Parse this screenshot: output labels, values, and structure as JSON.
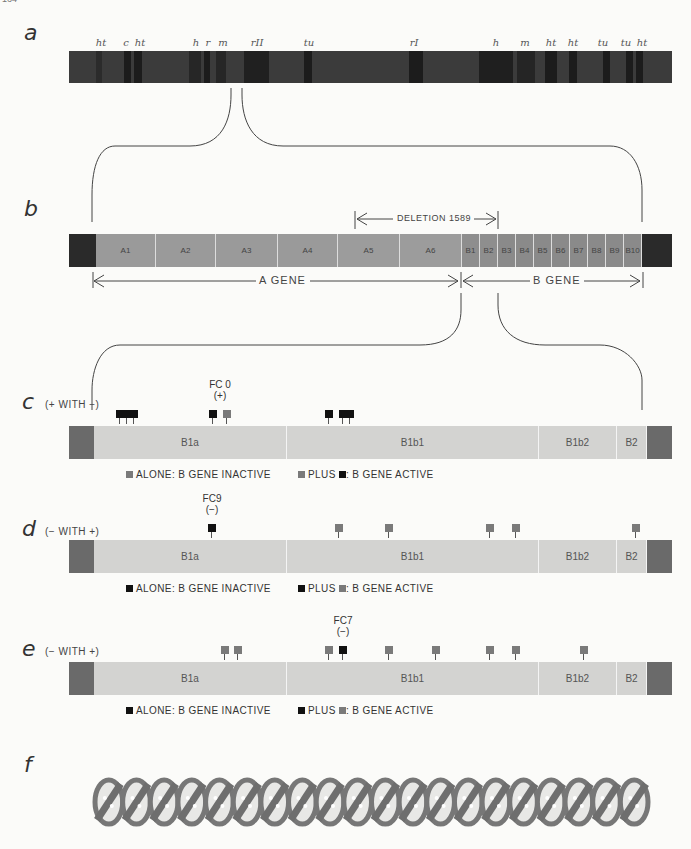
{
  "page_number": "164",
  "panels": {
    "a": {
      "letter": "a",
      "markers": [
        {
          "label": "ht",
          "x": 101
        },
        {
          "label": "c",
          "x": 126
        },
        {
          "label": "ht",
          "x": 140
        },
        {
          "label": "h",
          "x": 196
        },
        {
          "label": "r",
          "x": 208
        },
        {
          "label": "m",
          "x": 223
        },
        {
          "label": "rII",
          "x": 257
        },
        {
          "label": "tu",
          "x": 309
        },
        {
          "label": "rI",
          "x": 414
        },
        {
          "label": "h",
          "x": 496
        },
        {
          "label": "m",
          "x": 525
        },
        {
          "label": "ht",
          "x": 551
        },
        {
          "label": "ht",
          "x": 573
        },
        {
          "label": "tu",
          "x": 603
        },
        {
          "label": "tu",
          "x": 626
        },
        {
          "label": "ht",
          "x": 642
        }
      ]
    },
    "b": {
      "letter": "b",
      "deletion_label": "DELETION 1589",
      "a_gene_label": "A GENE",
      "b_gene_label": "B GENE",
      "segments": [
        "A1",
        "A2",
        "A3",
        "A4",
        "A5",
        "A6",
        "B1",
        "B2",
        "B3",
        "B4",
        "B5",
        "B6",
        "B7",
        "B8",
        "B9",
        "B10"
      ]
    },
    "c": {
      "letter": "c",
      "subtitle": "(+ WITH −)",
      "fc_label": "FC 0",
      "fc_sign": "(+)",
      "segments": [
        "B1a",
        "B1b1",
        "B1b2",
        "B2"
      ],
      "legend_left": "ALONE: B GENE INACTIVE",
      "legend_right_plus": "PLUS",
      "legend_right_rest": ": B GENE ACTIVE"
    },
    "d": {
      "letter": "d",
      "subtitle": "(− WITH +)",
      "fc_label": "FC9",
      "fc_sign": "(−)",
      "segments": [
        "B1a",
        "B1b1",
        "B1b2",
        "B2"
      ],
      "legend_left": "ALONE: B GENE INACTIVE",
      "legend_right_plus": "PLUS",
      "legend_right_rest": ": B GENE ACTIVE"
    },
    "e": {
      "letter": "e",
      "subtitle": "(− WITH +)",
      "fc_label": "FC7",
      "fc_sign": "(−)",
      "segments": [
        "B1a",
        "B1b1",
        "B1b2",
        "B2"
      ],
      "legend_left": "ALONE: B GENE INACTIVE",
      "legend_right_plus": "PLUS",
      "legend_right_rest": ": B GENE ACTIVE"
    },
    "f": {
      "letter": "f"
    }
  },
  "colors": {
    "black_marker": "#111111",
    "grey_marker": "#7a7a7a",
    "gene_bar": "#d3d3d1",
    "chromosome": "#3b3b3b"
  }
}
